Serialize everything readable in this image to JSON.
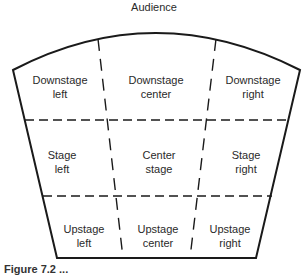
{
  "diagram": {
    "title": "Audience",
    "type": "stage-areas",
    "outline": {
      "stroke": "#1a1a1a",
      "divider_style": "dashed"
    },
    "rows": [
      {
        "name": "downstage",
        "cells": [
          {
            "line1": "Downstage",
            "line2": "left"
          },
          {
            "line1": "Downstage",
            "line2": "center"
          },
          {
            "line1": "Downstage",
            "line2": "right"
          }
        ]
      },
      {
        "name": "stage",
        "cells": [
          {
            "line1": "Stage",
            "line2": "left"
          },
          {
            "line1": "Center",
            "line2": "stage"
          },
          {
            "line1": "Stage",
            "line2": "right"
          }
        ]
      },
      {
        "name": "upstage",
        "cells": [
          {
            "line1": "Upstage",
            "line2": "left"
          },
          {
            "line1": "Upstage",
            "line2": "center"
          },
          {
            "line1": "Upstage",
            "line2": "right"
          }
        ]
      }
    ],
    "caption": "Figure 7.2 ..."
  }
}
